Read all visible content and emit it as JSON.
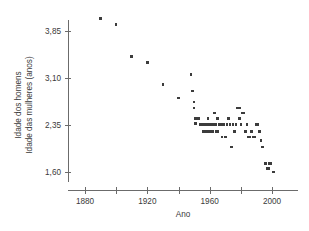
{
  "chart_data": {
    "type": "scatter",
    "title": "",
    "xlabel": "Ano",
    "ylabel_line1": "Idade dos homens",
    "ylabel_line2": "Idade das mulheres (anos)",
    "xlim": [
      1868,
      2012
    ],
    "ylim": [
      1.45,
      4.15
    ],
    "xticks_major": [
      1880,
      1920,
      1960,
      2000
    ],
    "xticks_minor": [
      1900,
      1940,
      1980
    ],
    "xtick_labels": [
      "1880",
      "1920",
      "1960",
      "2000"
    ],
    "yticks": [
      1.6,
      2.35,
      3.1,
      3.85
    ],
    "ytick_labels": [
      "1,60",
      "2,35",
      "3,10",
      "3,85"
    ],
    "grid": false,
    "legend": null,
    "marker": "square",
    "marker_color": "#3c3c3c",
    "axis_color": "#6b6b6b",
    "points": [
      {
        "x": 1890,
        "y": 4.05
      },
      {
        "x": 1900,
        "y": 3.95
      },
      {
        "x": 1910,
        "y": 3.44
      },
      {
        "x": 1920,
        "y": 3.35
      },
      {
        "x": 1930,
        "y": 3.0
      },
      {
        "x": 1940,
        "y": 2.78
      },
      {
        "x": 1948,
        "y": 3.16
      },
      {
        "x": 1949,
        "y": 2.89
      },
      {
        "x": 1950,
        "y": 2.72
      },
      {
        "x": 1950,
        "y": 2.62
      },
      {
        "x": 1951,
        "y": 2.45
      },
      {
        "x": 1951,
        "y": 2.37
      },
      {
        "x": 1953,
        "y": 2.45
      },
      {
        "x": 1954,
        "y": 2.36
      },
      {
        "x": 1955,
        "y": 2.36
      },
      {
        "x": 1956,
        "y": 2.36
      },
      {
        "x": 1956,
        "y": 2.25
      },
      {
        "x": 1957,
        "y": 2.25
      },
      {
        "x": 1958,
        "y": 2.36
      },
      {
        "x": 1958,
        "y": 2.25
      },
      {
        "x": 1959,
        "y": 2.45
      },
      {
        "x": 1960,
        "y": 2.36
      },
      {
        "x": 1960,
        "y": 2.25
      },
      {
        "x": 1961,
        "y": 2.36
      },
      {
        "x": 1962,
        "y": 2.36
      },
      {
        "x": 1962,
        "y": 2.25
      },
      {
        "x": 1963,
        "y": 2.54
      },
      {
        "x": 1963,
        "y": 2.36
      },
      {
        "x": 1964,
        "y": 2.36
      },
      {
        "x": 1964,
        "y": 2.25
      },
      {
        "x": 1965,
        "y": 2.45
      },
      {
        "x": 1965,
        "y": 2.25
      },
      {
        "x": 1966,
        "y": 2.36
      },
      {
        "x": 1967,
        "y": 2.36
      },
      {
        "x": 1968,
        "y": 2.16
      },
      {
        "x": 1969,
        "y": 2.36
      },
      {
        "x": 1970,
        "y": 2.16
      },
      {
        "x": 1971,
        "y": 2.36
      },
      {
        "x": 1972,
        "y": 2.45
      },
      {
        "x": 1973,
        "y": 2.36
      },
      {
        "x": 1974,
        "y": 2.0
      },
      {
        "x": 1975,
        "y": 2.36
      },
      {
        "x": 1976,
        "y": 2.25
      },
      {
        "x": 1977,
        "y": 2.36
      },
      {
        "x": 1978,
        "y": 2.62
      },
      {
        "x": 1979,
        "y": 2.62
      },
      {
        "x": 1979,
        "y": 2.45
      },
      {
        "x": 1980,
        "y": 2.36
      },
      {
        "x": 1981,
        "y": 2.54
      },
      {
        "x": 1982,
        "y": 2.54
      },
      {
        "x": 1983,
        "y": 2.25
      },
      {
        "x": 1984,
        "y": 2.36
      },
      {
        "x": 1985,
        "y": 2.16
      },
      {
        "x": 1986,
        "y": 2.16
      },
      {
        "x": 1987,
        "y": 2.25
      },
      {
        "x": 1988,
        "y": 2.16
      },
      {
        "x": 1989,
        "y": 2.16
      },
      {
        "x": 1990,
        "y": 2.36
      },
      {
        "x": 1991,
        "y": 2.36
      },
      {
        "x": 1992,
        "y": 2.25
      },
      {
        "x": 1993,
        "y": 2.1
      },
      {
        "x": 1994,
        "y": 2.0
      },
      {
        "x": 1996,
        "y": 1.74
      },
      {
        "x": 1998,
        "y": 1.74
      },
      {
        "x": 1999,
        "y": 1.74
      },
      {
        "x": 1997,
        "y": 1.66
      },
      {
        "x": 1998,
        "y": 1.66
      },
      {
        "x": 2001,
        "y": 1.6
      }
    ]
  },
  "axes": {
    "x_title": "Ano",
    "y_title_line1": "Idade dos homens",
    "y_title_line2": "Idade das mulheres (anos)"
  }
}
